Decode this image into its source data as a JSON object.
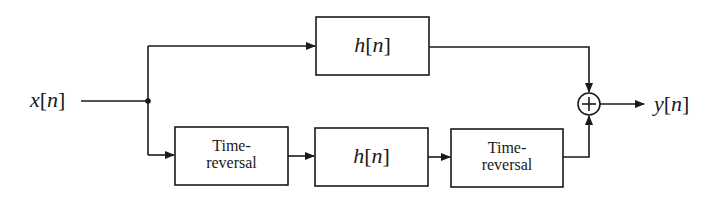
{
  "diagram": {
    "type": "block-diagram",
    "input": {
      "label": "x[n]",
      "var": "x",
      "index": "n"
    },
    "output": {
      "label": "y[n]",
      "var": "y",
      "index": "n"
    },
    "blocks": {
      "top_filter": {
        "label": "h[n]",
        "var": "h",
        "index": "n"
      },
      "time_reversal_1": {
        "line1": "Time-",
        "line2": "reversal"
      },
      "bottom_filter": {
        "label": "h[n]",
        "var": "h",
        "index": "n"
      },
      "time_reversal_2": {
        "line1": "Time-",
        "line2": "reversal"
      }
    },
    "adder": {
      "symbol": "+"
    },
    "connections": [
      "x[n] -> junction",
      "junction -> h[n] (top)",
      "junction -> Time-reversal (bottom)",
      "Time-reversal -> h[n] (bottom)",
      "h[n] (bottom) -> Time-reversal",
      "h[n] (top) -> adder",
      "Time-reversal -> adder",
      "adder -> y[n]"
    ],
    "colors": {
      "stroke": "#1a1a1a",
      "background": "#ffffff"
    }
  }
}
